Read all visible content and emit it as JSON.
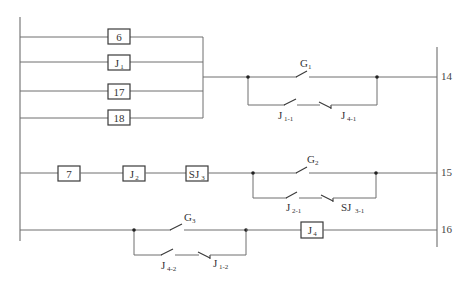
{
  "diagram": {
    "type": "relay ladder diagram",
    "rows": [
      {
        "number": "14",
        "parallel_inputs": [
          {
            "label": "6",
            "sub": ""
          },
          {
            "label": "J",
            "sub": "1"
          },
          {
            "label": "17",
            "sub": ""
          },
          {
            "label": "18",
            "sub": ""
          }
        ],
        "contacts": {
          "upper": {
            "label": "G",
            "sub": "1",
            "type": "normally-open"
          },
          "lower": [
            {
              "label": "J",
              "sub": "1-1",
              "type": "normally-open"
            },
            {
              "label": "J",
              "sub": "4-1",
              "type": "normally-closed"
            }
          ]
        }
      },
      {
        "number": "15",
        "series_boxes": [
          {
            "label": "7",
            "sub": ""
          },
          {
            "label": "J",
            "sub": "2"
          },
          {
            "label": "SJ",
            "sub": "3"
          }
        ],
        "contacts": {
          "upper": {
            "label": "G",
            "sub": "2",
            "type": "normally-open"
          },
          "lower": [
            {
              "label": "J",
              "sub": "2-1",
              "type": "normally-open"
            },
            {
              "label": "SJ",
              "sub": "3-1",
              "type": "normally-closed"
            }
          ]
        }
      },
      {
        "number": "16",
        "contacts": {
          "upper": {
            "label": "G",
            "sub": "3",
            "type": "normally-open"
          },
          "lower": [
            {
              "label": "J",
              "sub": "4-2",
              "type": "normally-open"
            },
            {
              "label": "J",
              "sub": "1-2",
              "type": "normally-closed"
            }
          ]
        },
        "coil": {
          "label": "J",
          "sub": "4"
        }
      }
    ]
  }
}
